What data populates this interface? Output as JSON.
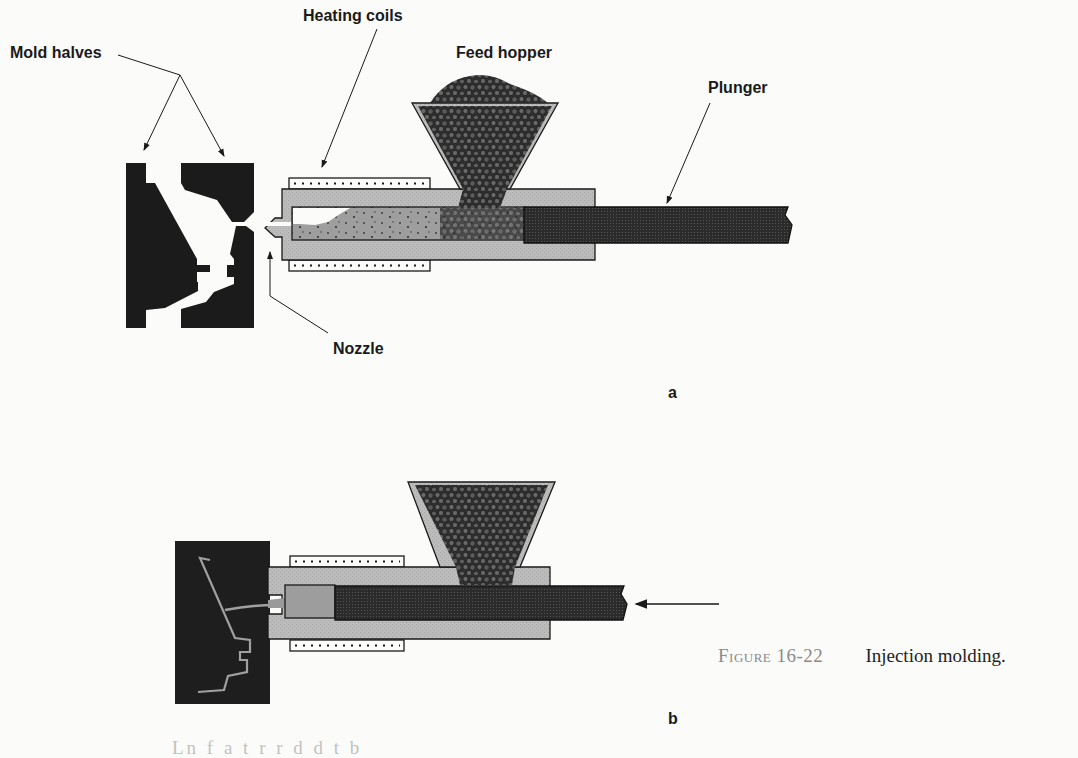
{
  "figure": {
    "number": "Figure 16-22",
    "caption": "Injection molding."
  },
  "panel_a": {
    "letter": "a",
    "labels": {
      "mold_halves": "Mold halves",
      "heating_coils": "Heating coils",
      "feed_hopper": "Feed hopper",
      "plunger": "Plunger",
      "nozzle": "Nozzle"
    }
  },
  "panel_b": {
    "letter": "b"
  },
  "colors": {
    "mold": "#1c1c1c",
    "barrel": "#bdbdbd",
    "plunger": "#2e2e2e",
    "pellets": "#3a3a3a",
    "melt": "#a9a9a9",
    "background": "#fbfbf9"
  },
  "bottom_text": "Ln f  a  t    r  r  d  d  t  b"
}
